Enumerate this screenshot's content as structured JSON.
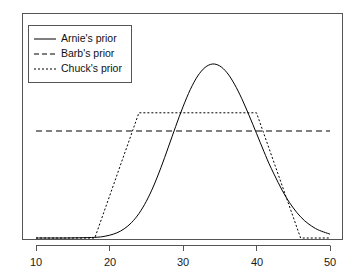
{
  "chart_data": {
    "type": "line",
    "title": "",
    "subtitle": "",
    "xlabel": "",
    "ylabel": "",
    "xlim": [
      10,
      50
    ],
    "ylim": [
      0,
      1.05
    ],
    "grid": false,
    "xticks": [
      10,
      20,
      30,
      40,
      50
    ],
    "xtick_labels": [
      "10",
      "20",
      "30",
      "40",
      "50"
    ],
    "yticks": [],
    "ytick_labels": [],
    "y_axis_visible": false,
    "box": true,
    "legend": {
      "position": "top-left",
      "border": true,
      "entries": [
        {
          "label": "Arnie's prior",
          "style": "solid",
          "dash": "none"
        },
        {
          "label": "Barb's prior",
          "style": "dashed",
          "dash": "6,4"
        },
        {
          "label": "Chuck's prior",
          "style": "dotted",
          "dash": "2,2"
        }
      ]
    },
    "series": [
      {
        "name": "Arnie's prior",
        "style": "solid",
        "shape": "normal",
        "mean": 30,
        "sd": 3.5,
        "peak_y": 1.0,
        "baseline_y": 0.0,
        "x": [
          10,
          12,
          14,
          16,
          18,
          19,
          20,
          21,
          22,
          23,
          24,
          25,
          26,
          27,
          28,
          29,
          30,
          31,
          32,
          33,
          34,
          35,
          36,
          37,
          38,
          39,
          40,
          41,
          42,
          44,
          46,
          48,
          50
        ],
        "values": [
          0.0,
          0.0,
          0.0,
          0.001,
          0.003,
          0.006,
          0.013,
          0.024,
          0.043,
          0.072,
          0.114,
          0.171,
          0.243,
          0.329,
          0.424,
          0.521,
          0.613,
          0.694,
          0.757,
          0.797,
          0.813,
          0.804,
          0.772,
          0.719,
          0.651,
          0.572,
          0.489,
          0.405,
          0.326,
          0.192,
          0.099,
          0.045,
          0.018
        ]
      },
      {
        "name": "Barb's prior",
        "style": "dashed",
        "shape": "uniform",
        "level_y": 0.5,
        "x_start": 10,
        "x_end": 50,
        "x": [
          10,
          50
        ],
        "values": [
          0.5,
          0.5
        ]
      },
      {
        "name": "Chuck's prior",
        "style": "dotted",
        "shape": "trapezoid",
        "plateau_y": 0.585,
        "baseline_y": 0.0,
        "x": [
          10,
          18,
          24,
          40,
          46,
          50
        ],
        "values": [
          0.0,
          0.0,
          0.585,
          0.585,
          0.0,
          0.0
        ],
        "ramp_up_start": 18,
        "ramp_up_end": 24,
        "ramp_down_start": 40,
        "ramp_down_end": 46
      }
    ],
    "colors": {
      "line": "#000000",
      "axis": "#444444",
      "background": "#ffffff",
      "text": "#111111"
    }
  },
  "legend_box": {
    "entries": [
      {
        "label": "Arnie's prior"
      },
      {
        "label": "Barb's prior"
      },
      {
        "label": "Chuck's prior"
      }
    ]
  },
  "axis": {
    "x_labels": [
      "10",
      "20",
      "30",
      "40",
      "50"
    ]
  }
}
